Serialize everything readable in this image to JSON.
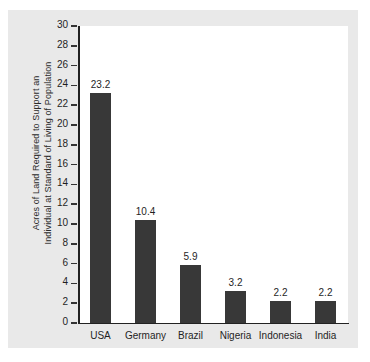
{
  "chart_data": {
    "type": "bar",
    "title": "",
    "xlabel": "",
    "ylabel": "Acres of Land Required to Support an Individual at Standard of Living of Population",
    "ylabel_lines": [
      "Acres of Land Required to Support an",
      "Individual at Standard of Living of Population"
    ],
    "categories": [
      "USA",
      "Germany",
      "Brazil",
      "Nigeria",
      "Indonesia",
      "India"
    ],
    "values": [
      23.2,
      10.4,
      5.9,
      3.2,
      2.2,
      2.2
    ],
    "value_labels": [
      "23.2",
      "10.4",
      "5.9",
      "3.2",
      "2.2",
      "2.2"
    ],
    "ylim": [
      0,
      30
    ],
    "ytick_step": 2,
    "ytick_labels": [
      "30",
      "28",
      "26",
      "24",
      "22",
      "20",
      "18",
      "16",
      "14",
      "12",
      "10",
      "8",
      "6",
      "4",
      "2",
      "0"
    ],
    "grid": false,
    "legend": false,
    "bar_color": "#383838",
    "plot_background": "#ffffff",
    "card_background": "#e9e9e9"
  }
}
